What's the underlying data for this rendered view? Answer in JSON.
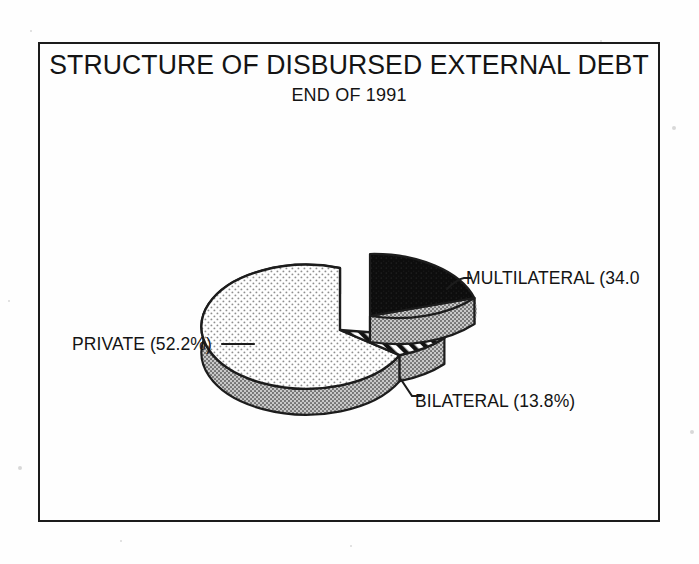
{
  "figure": {
    "title": "STRUCTURE OF DISBURSED EXTERNAL DEBT",
    "subtitle": "END OF 1991"
  },
  "labels": {
    "multilateral": "MULTILATERAL (34.0",
    "private": "PRIVATE (52.2%)",
    "bilateral": "BILATERAL (13.8%)"
  },
  "colors": {
    "ink": "#1c1c1c",
    "paper": "#fefefe",
    "multilateral_fill": "#0d0d0d",
    "private_fill": "#fbfbfb",
    "bilateral_fill": "#ffffff",
    "side_wall": "#a8a8a8"
  },
  "chart_data": {
    "type": "pie",
    "title": "STRUCTURE OF DISBURSED EXTERNAL DEBT",
    "subtitle": "END OF 1991",
    "three_d": true,
    "exploded_slice": "MULTILATERAL",
    "legend_position": "callout-labels",
    "units": "percent",
    "categories": [
      "PRIVATE",
      "MULTILATERAL",
      "BILATERAL"
    ],
    "values": [
      52.2,
      34.0,
      13.8
    ],
    "labels": [
      "PRIVATE (52.2%)",
      "MULTILATERAL (34.0",
      "BILATERAL (13.8%)"
    ],
    "slices": [
      {
        "name": "PRIVATE",
        "value": 52.2,
        "label": "PRIVATE (52.2%)",
        "fill": "stipple-dots",
        "exploded": false
      },
      {
        "name": "MULTILATERAL",
        "value": 34.0,
        "label": "MULTILATERAL (34.0",
        "fill": "solid-black",
        "exploded": true,
        "label_clipped": true
      },
      {
        "name": "BILATERAL",
        "value": 13.8,
        "label": "BILATERAL (13.8%)",
        "fill": "diagonal-hatch",
        "exploded": false
      }
    ]
  }
}
